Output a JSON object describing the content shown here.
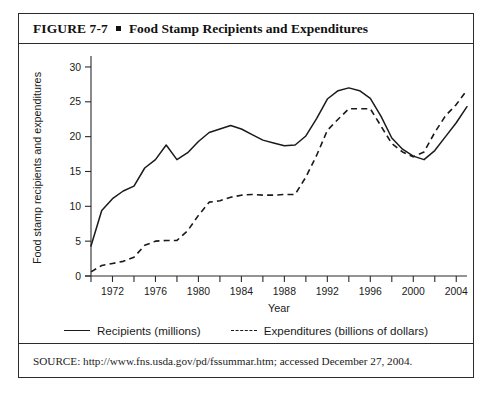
{
  "figure": {
    "number": "FIGURE 7-7",
    "title": "Food Stamp Recipients and Expenditures",
    "source": "SOURCE: http://www.fns.usda.gov/pd/fssummar.htm; accessed December 27, 2004."
  },
  "chart_data": {
    "type": "line",
    "title": "Food Stamp Recipients and Expenditures",
    "xlabel": "Year",
    "ylabel": "Food stamp recipients and expenditures",
    "xlim": [
      1970,
      2005
    ],
    "ylim": [
      0,
      31
    ],
    "yticks": [
      0,
      5,
      10,
      15,
      20,
      25,
      30
    ],
    "xticks": [
      1972,
      1976,
      1980,
      1984,
      1988,
      1992,
      1996,
      2000,
      2004
    ],
    "xminor_step": 2,
    "grid": false,
    "legend_position": "bottom",
    "x": [
      1970,
      1971,
      1972,
      1973,
      1974,
      1975,
      1976,
      1977,
      1978,
      1979,
      1980,
      1981,
      1982,
      1983,
      1984,
      1985,
      1986,
      1987,
      1988,
      1989,
      1990,
      1991,
      1992,
      1993,
      1994,
      1995,
      1996,
      1997,
      1998,
      1999,
      2000,
      2001,
      2002,
      2003,
      2004,
      2005
    ],
    "series": [
      {
        "name": "Recipients (millions)",
        "style": "solid",
        "unit": "millions",
        "values": [
          4.3,
          9.4,
          11.1,
          12.2,
          12.9,
          15.5,
          16.7,
          18.8,
          16.7,
          17.7,
          19.3,
          20.6,
          21.1,
          21.6,
          21.1,
          20.3,
          19.5,
          19.1,
          18.7,
          18.8,
          20.1,
          22.6,
          25.4,
          26.6,
          27.0,
          26.6,
          25.5,
          22.9,
          19.8,
          18.2,
          17.2,
          16.7,
          18.0,
          20.0,
          22.0,
          24.3
        ]
      },
      {
        "name": "Expenditures (billions of dollars)",
        "style": "dashed",
        "unit": "billions of dollars",
        "values": [
          0.6,
          1.5,
          1.8,
          2.1,
          2.7,
          4.4,
          5.0,
          5.1,
          5.1,
          6.5,
          8.7,
          10.6,
          10.8,
          11.3,
          11.6,
          11.7,
          11.6,
          11.6,
          11.7,
          11.7,
          14.2,
          17.3,
          20.9,
          22.5,
          24.0,
          24.0,
          24.0,
          21.5,
          19.0,
          17.8,
          17.1,
          17.8,
          20.6,
          23.0,
          24.6,
          26.7
        ]
      }
    ]
  },
  "legend": {
    "items": [
      {
        "label": "Recipients (millions)",
        "style": "solid"
      },
      {
        "label": "Expenditures (billions of dollars)",
        "style": "dashed"
      }
    ]
  },
  "colors": {
    "ink": "#1a1a1a",
    "frame": "#2b2b2b",
    "background": "#ffffff"
  }
}
